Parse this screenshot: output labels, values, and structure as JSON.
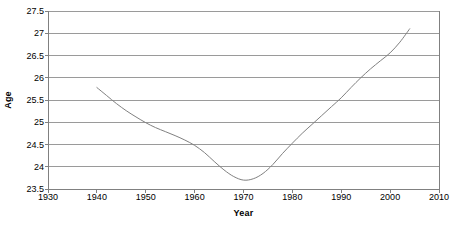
{
  "chart_data": {
    "type": "line",
    "title": "",
    "xlabel": "Year",
    "ylabel": "Age",
    "xlim": [
      1930,
      2010
    ],
    "ylim": [
      23.5,
      27.5
    ],
    "xticks": [
      1930,
      1940,
      1950,
      1960,
      1970,
      1980,
      1990,
      2000,
      2010
    ],
    "xtick_labels": [
      "1930",
      "1940",
      "1950",
      "1960",
      "1970",
      "1980",
      "1990",
      "2000",
      "2010"
    ],
    "yticks": [
      23.5,
      24,
      24.5,
      25,
      25.5,
      26,
      26.5,
      27,
      27.5
    ],
    "ytick_labels": [
      "23.5",
      "24",
      "24.5",
      "25",
      "25.5",
      "26",
      "26.5",
      "27",
      "27.5"
    ],
    "grid": "horizontal",
    "legend": "none",
    "line_color": "#808080",
    "grid_color": "#9a9a9a",
    "axis_color": "#808080",
    "background_color": "#ffffff",
    "series": [
      {
        "name": "Age",
        "x": [
          1940,
          1942,
          1944,
          1946,
          1948,
          1950,
          1952,
          1954,
          1956,
          1958,
          1960,
          1962,
          1964,
          1966,
          1968,
          1970,
          1972,
          1974,
          1976,
          1978,
          1980,
          1982,
          1984,
          1986,
          1988,
          1990,
          1992,
          1994,
          1996,
          1998,
          2000,
          2002,
          2004
        ],
        "values": [
          25.78,
          25.6,
          25.42,
          25.26,
          25.12,
          24.99,
          24.88,
          24.79,
          24.7,
          24.6,
          24.48,
          24.32,
          24.12,
          23.93,
          23.78,
          23.7,
          23.73,
          23.85,
          24.05,
          24.3,
          24.53,
          24.75,
          24.95,
          25.15,
          25.35,
          25.55,
          25.78,
          26.0,
          26.2,
          26.38,
          26.56,
          26.8,
          27.1
        ]
      }
    ]
  }
}
